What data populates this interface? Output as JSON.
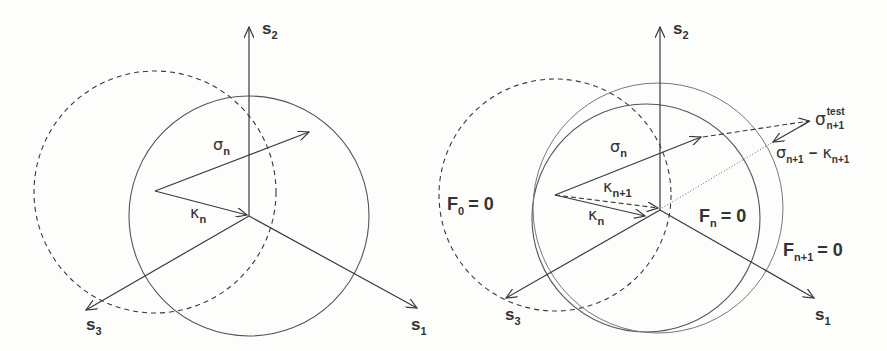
{
  "figure": {
    "left_panel": {
      "axes": {
        "s1": {
          "label": "s",
          "sub": "1"
        },
        "s2": {
          "label": "s",
          "sub": "2"
        },
        "s3": {
          "label": "s",
          "sub": "3"
        }
      },
      "vectors": {
        "sigma_n": {
          "symbol": "σ",
          "sub": "n"
        },
        "kappa_n": {
          "symbol": "κ",
          "sub": "n"
        }
      }
    },
    "right_panel": {
      "axes": {
        "s1": {
          "label": "s",
          "sub": "1"
        },
        "s2": {
          "label": "s",
          "sub": "2"
        },
        "s3": {
          "label": "s",
          "sub": "3"
        }
      },
      "vectors": {
        "sigma_n": {
          "symbol": "σ",
          "sub": "n"
        },
        "kappa_n": {
          "symbol": "κ",
          "sub": "n"
        },
        "kappa_n1": {
          "symbol": "κ",
          "sub": "n+1"
        },
        "sigma_test": {
          "symbol": "σ",
          "sub": "n+1",
          "sup": "test"
        },
        "diff": {
          "symbol_a": "σ",
          "sub_a": "n+1",
          "op": "−",
          "symbol_b": "κ",
          "sub_b": "n+1"
        }
      },
      "surfaces": {
        "f0": {
          "label": "F",
          "sub": "0",
          "eq": "= 0"
        },
        "fn": {
          "label": "F",
          "sub": "n",
          "eq": "= 0"
        },
        "fn1": {
          "label": "F",
          "sub": "n+1",
          "eq": "= 0"
        }
      }
    },
    "colors": {
      "line": "#3a3a3a",
      "light_line": "#777777",
      "background": "#fdfdfc"
    }
  }
}
